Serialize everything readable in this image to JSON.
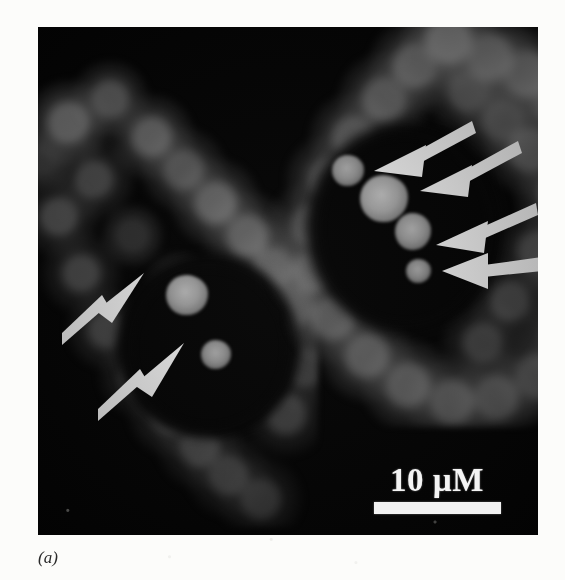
{
  "figure": {
    "panel_label": "(a)",
    "modality": "fluorescence-micrograph",
    "background_color": "#050505",
    "page_color": "#fcfcfa"
  },
  "scale_bar": {
    "label": "10 µM",
    "value": 10,
    "unit": "µM",
    "bar_color": "#f2f2f2",
    "text_color": "#f4f4f4",
    "bar_length_px": 127
  },
  "annotations": {
    "marker_type": "arrow",
    "marker_color": "#ffffff",
    "count": 6,
    "arrows": [
      {
        "id": "arrow-left-cell-upper",
        "target": "focus-left-1",
        "direction": "up-right"
      },
      {
        "id": "arrow-left-cell-lower",
        "target": "focus-left-2",
        "direction": "up-right"
      },
      {
        "id": "arrow-right-cell-1",
        "target": "focus-right-1",
        "direction": "down-left"
      },
      {
        "id": "arrow-right-cell-2",
        "target": "focus-right-2",
        "direction": "down-left"
      },
      {
        "id": "arrow-right-cell-3",
        "target": "focus-right-3",
        "direction": "left"
      },
      {
        "id": "arrow-right-cell-4",
        "target": "focus-right-4",
        "direction": "left"
      }
    ]
  },
  "cells": [
    {
      "id": "cell-left",
      "label": "left cell",
      "nucleus_label": "nucleus",
      "foci_count": 2,
      "foci": [
        {
          "id": "focus-left-1",
          "size": "medium",
          "brightness": "#9a9a9a"
        },
        {
          "id": "focus-left-2",
          "size": "small",
          "brightness": "#8e8e8e"
        }
      ]
    },
    {
      "id": "cell-right",
      "label": "right cell",
      "nucleus_label": "nucleus",
      "foci_count": 4,
      "foci": [
        {
          "id": "focus-right-1",
          "size": "small",
          "brightness": "#8d8d8d"
        },
        {
          "id": "focus-right-2",
          "size": "large",
          "brightness": "#a0a0a0"
        },
        {
          "id": "focus-right-3",
          "size": "medium",
          "brightness": "#949494"
        },
        {
          "id": "focus-right-4",
          "size": "small",
          "brightness": "#8a8a8a"
        }
      ]
    }
  ]
}
